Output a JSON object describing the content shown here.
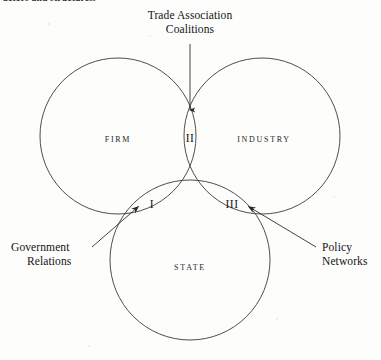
{
  "page": {
    "header_fragment": "actors and structures.",
    "background_color": "#fdfdfc",
    "ink_color": "#1a1a1a",
    "width": 381,
    "height": 360
  },
  "diagram": {
    "type": "venn-three-circle",
    "stroke_color": "#3a3a3a",
    "stroke_width": 0.9,
    "circles": [
      {
        "id": "firm",
        "label": "FIRM",
        "cx": 118,
        "cy": 136,
        "r": 78,
        "label_x": 118,
        "label_y": 140
      },
      {
        "id": "industry",
        "label": "INDUSTRY",
        "cx": 262,
        "cy": 136,
        "r": 78,
        "label_x": 264,
        "label_y": 140
      },
      {
        "id": "state",
        "label": "STATE",
        "cx": 190,
        "cy": 260,
        "r": 80,
        "label_x": 190,
        "label_y": 268
      }
    ],
    "regions": [
      {
        "id": "region-1",
        "numeral": "I",
        "description": "firm and state overlap",
        "x": 152,
        "y": 205
      },
      {
        "id": "region-2",
        "numeral": "II",
        "description": "firm and industry overlap",
        "x": 190,
        "y": 139
      },
      {
        "id": "region-3",
        "numeral": "III",
        "description": "industry and state overlap",
        "x": 232,
        "y": 205
      }
    ],
    "callouts": [
      {
        "id": "trade-association-coalitions",
        "line1": "Trade Association",
        "line2": "Coalitions",
        "target_region": "II",
        "text_x": 190,
        "text_y": 10,
        "leader": {
          "x1": 190,
          "y1": 44,
          "x2": 190,
          "y2": 112
        },
        "arrow": "down"
      },
      {
        "id": "government-relations",
        "line1": "Government",
        "line2": "Relations",
        "target_region": "I",
        "text_x": 12,
        "text_y": 242,
        "leader": {
          "x1": 96,
          "y1": 243,
          "x2": 139,
          "y2": 206
        },
        "arrow": "up-right"
      },
      {
        "id": "policy-networks",
        "line1": "Policy",
        "line2": "Networks",
        "target_region": "III",
        "text_x": 324,
        "text_y": 242,
        "leader": {
          "x1": 312,
          "y1": 243,
          "x2": 248,
          "y2": 206
        },
        "arrow": "up-left"
      }
    ],
    "intersection_points": {
      "firm_industry_top": {
        "x": 190,
        "y": 95
      },
      "triple_left": {
        "x": 113,
        "y": 225
      },
      "triple_right": {
        "x": 268,
        "y": 225
      }
    }
  }
}
